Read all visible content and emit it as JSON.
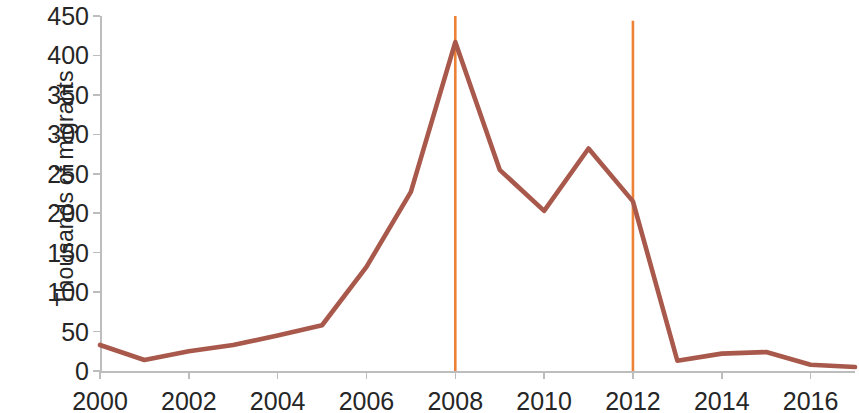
{
  "chart_data": {
    "type": "line",
    "title": "",
    "subtitle": "",
    "xlabel": "",
    "ylabel": "Thousands of migrants",
    "x": [
      2000,
      2001,
      2002,
      2003,
      2004,
      2005,
      2006,
      2007,
      2008,
      2009,
      2010,
      2011,
      2012,
      2013,
      2014,
      2015,
      2016,
      2017
    ],
    "series": [
      {
        "name": "Migrants",
        "color": "#a8594b",
        "values": [
          33,
          14,
          25,
          33,
          45,
          58,
          132,
          227,
          417,
          255,
          203,
          282,
          215,
          13,
          22,
          24,
          8,
          5
        ]
      }
    ],
    "x_tick_labels": [
      "2000",
      "2002",
      "2004",
      "2006",
      "2008",
      "2010",
      "2012",
      "2014",
      "2016"
    ],
    "x_tick_values": [
      2000,
      2002,
      2004,
      2006,
      2008,
      2010,
      2012,
      2014,
      2016
    ],
    "y_tick_labels": [
      "0",
      "50",
      "100",
      "150",
      "200",
      "250",
      "300",
      "350",
      "400",
      "450"
    ],
    "y_tick_values": [
      0,
      50,
      100,
      150,
      200,
      250,
      300,
      350,
      400,
      450
    ],
    "xlim": [
      2000,
      2017
    ],
    "ylim": [
      0,
      450
    ],
    "grid": false,
    "legend": false,
    "annotations": [
      {
        "name": "marker-2008",
        "type": "vertical-line",
        "x": 2008,
        "y_top": 450,
        "color": "#ed8136"
      },
      {
        "name": "marker-2012",
        "type": "vertical-line",
        "x": 2012,
        "y_top": 444,
        "color": "#ed8136"
      }
    ],
    "axis_color": "#bdbdbd"
  }
}
